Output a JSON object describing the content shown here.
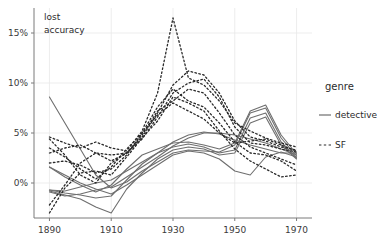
{
  "chart_data": {
    "type": "line",
    "title": "",
    "xlabel": "",
    "ylabel": "lost accuracy",
    "ylabel_lines": [
      "lost",
      "accuracy"
    ],
    "xlim": [
      1885,
      1975
    ],
    "ylim": [
      -0.035,
      0.175
    ],
    "grid": true,
    "x_ticks": [
      1890,
      1910,
      1930,
      1950,
      1970
    ],
    "x_tick_labels": [
      "1890",
      "1910",
      "1930",
      "1950",
      "1970"
    ],
    "y_ticks": [
      0,
      0.05,
      0.1,
      0.15
    ],
    "y_tick_labels": [
      "0%",
      "5%",
      "10%",
      "15%"
    ],
    "legend": {
      "title": "genre",
      "position": "right",
      "entries": [
        {
          "label": "detective",
          "style": "solid",
          "color": "#6e6e6e"
        },
        {
          "label": "SF",
          "style": "dashed",
          "color": "#2a2a2a"
        }
      ]
    },
    "series": [
      {
        "name": "detective-1",
        "genre": "detective",
        "style": "solid",
        "color": "#6e6e6e",
        "x": [
          1890,
          1895,
          1900,
          1905,
          1910,
          1915,
          1920,
          1925,
          1930,
          1935,
          1940,
          1945,
          1950,
          1955,
          1960,
          1965,
          1970
        ],
        "y": [
          0.086,
          0.06,
          0.034,
          0.008,
          -0.005,
          0.001,
          0.012,
          0.021,
          0.03,
          0.033,
          0.032,
          0.031,
          0.038,
          0.07,
          0.075,
          0.045,
          0.027
        ]
      },
      {
        "name": "detective-2",
        "genre": "detective",
        "style": "solid",
        "color": "#6e6e6e",
        "x": [
          1890,
          1895,
          1900,
          1905,
          1910,
          1915,
          1920,
          1925,
          1930,
          1935,
          1940,
          1945,
          1950,
          1955,
          1960,
          1965,
          1970
        ],
        "y": [
          0.016,
          0.006,
          -0.002,
          -0.009,
          -0.002,
          0.014,
          0.028,
          0.034,
          0.04,
          0.041,
          0.038,
          0.034,
          0.04,
          0.072,
          0.078,
          0.048,
          0.029
        ]
      },
      {
        "name": "detective-3",
        "genre": "detective",
        "style": "solid",
        "color": "#6e6e6e",
        "x": [
          1890,
          1895,
          1900,
          1905,
          1910,
          1915,
          1920,
          1925,
          1930,
          1935,
          1940,
          1945,
          1950,
          1955,
          1960,
          1965,
          1970
        ],
        "y": [
          -0.007,
          -0.01,
          -0.012,
          -0.015,
          -0.013,
          0.003,
          0.019,
          0.03,
          0.036,
          0.039,
          0.036,
          0.03,
          0.033,
          0.065,
          0.07,
          0.041,
          0.025
        ]
      },
      {
        "name": "detective-4",
        "genre": "detective",
        "style": "solid",
        "color": "#6e6e6e",
        "x": [
          1890,
          1895,
          1900,
          1905,
          1910,
          1915,
          1920,
          1925,
          1930,
          1935,
          1940,
          1945,
          1950,
          1955,
          1960,
          1965,
          1970
        ],
        "y": [
          -0.008,
          -0.012,
          -0.016,
          -0.024,
          -0.03,
          -0.006,
          0.01,
          0.024,
          0.033,
          0.036,
          0.034,
          0.028,
          0.03,
          0.06,
          0.066,
          0.038,
          0.024
        ]
      },
      {
        "name": "detective-5",
        "genre": "detective",
        "style": "solid",
        "color": "#6e6e6e",
        "x": [
          1890,
          1895,
          1900,
          1905,
          1910,
          1915,
          1920,
          1925,
          1930,
          1935,
          1940,
          1945,
          1950,
          1955,
          1960,
          1965,
          1970
        ],
        "y": [
          -0.009,
          -0.013,
          -0.011,
          -0.007,
          -0.004,
          0.006,
          0.016,
          0.026,
          0.037,
          0.045,
          0.05,
          0.05,
          0.048,
          0.044,
          0.04,
          0.034,
          0.028
        ]
      },
      {
        "name": "detective-6",
        "genre": "detective",
        "style": "solid",
        "color": "#6e6e6e",
        "x": [
          1890,
          1895,
          1900,
          1905,
          1910,
          1915,
          1920,
          1925,
          1930,
          1935,
          1940,
          1945,
          1950,
          1955,
          1960,
          1965,
          1970
        ],
        "y": [
          -0.007,
          -0.008,
          -0.004,
          0.0,
          0.003,
          0.012,
          0.021,
          0.03,
          0.041,
          0.048,
          0.051,
          0.049,
          0.043,
          0.038,
          0.034,
          0.03,
          0.03
        ]
      },
      {
        "name": "detective-7",
        "genre": "detective",
        "style": "solid",
        "color": "#6e6e6e",
        "x": [
          1890,
          1895,
          1900,
          1905,
          1910,
          1915,
          1920,
          1925,
          1930,
          1935,
          1940,
          1945,
          1950,
          1955,
          1960,
          1965,
          1970
        ],
        "y": [
          0.016,
          0.008,
          0.0,
          -0.006,
          -0.011,
          -0.002,
          0.008,
          0.018,
          0.028,
          0.032,
          0.03,
          0.024,
          0.012,
          0.008,
          0.026,
          0.031,
          0.026
        ]
      },
      {
        "name": "SF-1",
        "genre": "SF",
        "style": "dashed",
        "color": "#2a2a2a",
        "x": [
          1890,
          1895,
          1900,
          1905,
          1910,
          1915,
          1920,
          1925,
          1930,
          1935,
          1940,
          1945,
          1950,
          1955,
          1960,
          1965,
          1970
        ],
        "y": [
          0.046,
          0.04,
          0.035,
          0.041,
          0.035,
          0.032,
          0.052,
          0.09,
          0.165,
          0.105,
          0.098,
          0.082,
          0.06,
          0.052,
          0.045,
          0.04,
          0.036
        ]
      },
      {
        "name": "SF-2",
        "genre": "SF",
        "style": "dashed",
        "color": "#2a2a2a",
        "x": [
          1890,
          1895,
          1900,
          1905,
          1910,
          1915,
          1920,
          1925,
          1930,
          1935,
          1940,
          1945,
          1950,
          1955,
          1960,
          1965,
          1970
        ],
        "y": [
          -0.022,
          -0.002,
          0.02,
          0.03,
          0.028,
          0.03,
          0.046,
          0.07,
          0.098,
          0.112,
          0.108,
          0.09,
          0.062,
          0.046,
          0.042,
          0.036,
          0.033
        ]
      },
      {
        "name": "SF-3",
        "genre": "SF",
        "style": "dashed",
        "color": "#2a2a2a",
        "x": [
          1890,
          1895,
          1900,
          1905,
          1910,
          1915,
          1920,
          1925,
          1930,
          1935,
          1940,
          1945,
          1950,
          1955,
          1960,
          1965,
          1970
        ],
        "y": [
          0.044,
          0.028,
          0.008,
          0.0,
          0.02,
          0.03,
          0.044,
          0.066,
          0.09,
          0.1,
          0.104,
          0.086,
          0.056,
          0.04,
          0.038,
          0.034,
          0.031
        ]
      },
      {
        "name": "SF-4",
        "genre": "SF",
        "style": "dashed",
        "color": "#2a2a2a",
        "x": [
          1890,
          1895,
          1900,
          1905,
          1910,
          1915,
          1920,
          1925,
          1930,
          1935,
          1940,
          1945,
          1950,
          1955,
          1960,
          1965,
          1970
        ],
        "y": [
          0.03,
          0.035,
          0.038,
          0.03,
          0.022,
          0.03,
          0.048,
          0.072,
          0.082,
          0.094,
          0.09,
          0.07,
          0.048,
          0.036,
          0.03,
          0.024,
          0.018
        ]
      },
      {
        "name": "SF-5",
        "genre": "SF",
        "style": "dashed",
        "color": "#2a2a2a",
        "x": [
          1890,
          1895,
          1900,
          1905,
          1910,
          1915,
          1920,
          1925,
          1930,
          1935,
          1940,
          1945,
          1950,
          1955,
          1960,
          1965,
          1970
        ],
        "y": [
          0.02,
          0.022,
          0.018,
          0.01,
          0.014,
          0.028,
          0.05,
          0.076,
          0.094,
          0.082,
          0.076,
          0.06,
          0.041,
          0.03,
          0.028,
          0.022,
          0.012
        ]
      },
      {
        "name": "SF-6",
        "genre": "SF",
        "style": "dashed",
        "color": "#2a2a2a",
        "x": [
          1890,
          1895,
          1900,
          1905,
          1910,
          1915,
          1920,
          1925,
          1930,
          1935,
          1940,
          1945,
          1950,
          1955,
          1960,
          1965,
          1970
        ],
        "y": [
          -0.03,
          -0.005,
          0.01,
          0.012,
          0.008,
          0.026,
          0.045,
          0.062,
          0.086,
          0.08,
          0.072,
          0.052,
          0.034,
          0.022,
          0.014,
          0.006,
          0.008
        ]
      },
      {
        "name": "SF-7",
        "genre": "SF",
        "style": "dashed",
        "color": "#2a2a2a",
        "x": [
          1890,
          1895,
          1900,
          1905,
          1910,
          1915,
          1920,
          1925,
          1930,
          1935,
          1940,
          1945,
          1950,
          1955,
          1960,
          1965,
          1970
        ],
        "y": [
          0.035,
          0.026,
          0.014,
          0.004,
          0.016,
          0.034,
          0.05,
          0.068,
          0.08,
          0.072,
          0.064,
          0.05,
          0.04,
          0.042,
          0.044,
          0.038,
          0.032
        ]
      }
    ]
  }
}
